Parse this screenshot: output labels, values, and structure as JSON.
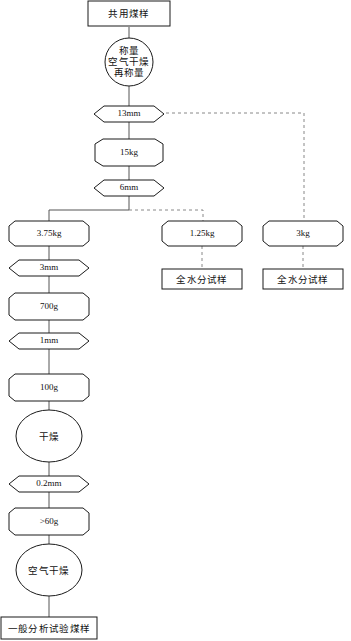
{
  "diagram": {
    "canvas": {
      "width": 351,
      "height": 641
    },
    "colors": {
      "background": "#ffffff",
      "node_stroke": "#1a1a1a",
      "node_fill": "#ffffff",
      "edge_solid": "#555555",
      "edge_dashed": "#888888",
      "text": "#111111"
    }
  },
  "nodes": {
    "common_sample": {
      "label": "共用煤样",
      "shape": "rectangle",
      "cx": 129,
      "cy": 13
    },
    "weigh_airdry_reweigh": {
      "lines": [
        "称量",
        "空气干燥",
        "再称量"
      ],
      "shape": "circle",
      "cx": 129,
      "cy": 62
    },
    "sieve_13mm": {
      "label": "13mm",
      "shape": "hexagon",
      "cx": 129,
      "cy": 114
    },
    "mass_15kg": {
      "label": "15kg",
      "shape": "octagon",
      "cx": 129,
      "cy": 152
    },
    "sieve_6mm": {
      "label": "6mm",
      "shape": "hexagon",
      "cx": 129,
      "cy": 188
    },
    "mass_375kg": {
      "label": "3.75kg",
      "shape": "octagon",
      "cx": 49,
      "cy": 233
    },
    "mass_125kg": {
      "label": "1.25kg",
      "shape": "octagon",
      "cx": 202,
      "cy": 233
    },
    "mass_3kg": {
      "label": "3kg",
      "shape": "octagon",
      "cx": 303,
      "cy": 233
    },
    "total_moisture_a": {
      "label": "全水分试样",
      "shape": "rectangle",
      "cx": 202,
      "cy": 279
    },
    "total_moisture_b": {
      "label": "全水分试样",
      "shape": "rectangle",
      "cx": 303,
      "cy": 279
    },
    "sieve_3mm": {
      "label": "3mm",
      "shape": "hexagon",
      "cx": 49,
      "cy": 268
    },
    "mass_700g": {
      "label": "700g",
      "shape": "octagon",
      "cx": 49,
      "cy": 306
    },
    "sieve_1mm": {
      "label": "1mm",
      "shape": "hexagon",
      "cx": 49,
      "cy": 341
    },
    "mass_100g": {
      "label": "100g",
      "shape": "octagon",
      "cx": 49,
      "cy": 387
    },
    "drying": {
      "label": "干燥",
      "shape": "ellipse",
      "cx": 49,
      "cy": 436
    },
    "sieve_02mm": {
      "label": "0.2mm",
      "shape": "hexagon",
      "cx": 49,
      "cy": 484
    },
    "mass_gt60g": {
      "label": ">60g",
      "shape": "octagon",
      "cx": 49,
      "cy": 521
    },
    "air_drying": {
      "label": "空气干燥",
      "shape": "ellipse",
      "cx": 49,
      "cy": 570
    },
    "general_analysis_sample": {
      "label": "一般分析试验煤样",
      "shape": "rectangle",
      "cx": 49,
      "cy": 628
    }
  },
  "edges": [
    {
      "from": "common_sample",
      "to": "weigh_airdry_reweigh",
      "style": "solid"
    },
    {
      "from": "weigh_airdry_reweigh",
      "to": "sieve_13mm",
      "style": "solid"
    },
    {
      "from": "sieve_13mm",
      "to": "mass_15kg",
      "style": "solid"
    },
    {
      "from": "sieve_13mm",
      "to": "mass_3kg",
      "style": "dashed"
    },
    {
      "from": "mass_15kg",
      "to": "sieve_6mm",
      "style": "solid"
    },
    {
      "from": "sieve_6mm",
      "to": "mass_375kg",
      "style": "solid"
    },
    {
      "from": "sieve_6mm",
      "to": "mass_125kg",
      "style": "dashed"
    },
    {
      "from": "mass_125kg",
      "to": "total_moisture_a",
      "style": "dashed"
    },
    {
      "from": "mass_3kg",
      "to": "total_moisture_b",
      "style": "dashed"
    },
    {
      "from": "mass_375kg",
      "to": "sieve_3mm",
      "style": "solid"
    },
    {
      "from": "sieve_3mm",
      "to": "mass_700g",
      "style": "solid"
    },
    {
      "from": "mass_700g",
      "to": "sieve_1mm",
      "style": "solid"
    },
    {
      "from": "sieve_1mm",
      "to": "mass_100g",
      "style": "solid"
    },
    {
      "from": "mass_100g",
      "to": "drying",
      "style": "solid"
    },
    {
      "from": "drying",
      "to": "sieve_02mm",
      "style": "solid"
    },
    {
      "from": "sieve_02mm",
      "to": "mass_gt60g",
      "style": "solid"
    },
    {
      "from": "mass_gt60g",
      "to": "air_drying",
      "style": "solid"
    },
    {
      "from": "air_drying",
      "to": "general_analysis_sample",
      "style": "solid"
    }
  ]
}
